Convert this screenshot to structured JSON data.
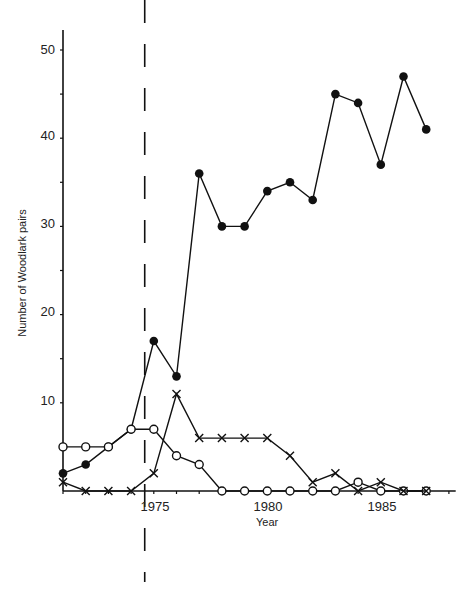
{
  "chart_data": {
    "type": "line",
    "title": "",
    "xlabel": "Year",
    "ylabel": "Number of Woodlark pairs",
    "x": [
      1971,
      1972,
      1973,
      1974,
      1975,
      1976,
      1977,
      1978,
      1979,
      1980,
      1981,
      1982,
      1983,
      1984,
      1985,
      1986,
      1987
    ],
    "xticks": [
      1975,
      1980,
      1985
    ],
    "yticks": [
      10,
      20,
      30,
      40,
      50
    ],
    "ylim": [
      0,
      52
    ],
    "xlim": [
      1971,
      1988.3
    ],
    "grid": false,
    "legend": "none",
    "annotations": [
      {
        "type": "vertical-dashed-line",
        "x": 1974.6
      }
    ],
    "series": [
      {
        "name": "filled-circles",
        "marker": "filled-circle",
        "values": [
          2,
          3,
          5,
          7,
          17,
          13,
          36,
          30,
          30,
          34,
          35,
          33,
          45,
          44,
          37,
          47,
          41
        ]
      },
      {
        "name": "open-circles",
        "marker": "open-circle",
        "values": [
          5,
          5,
          5,
          7,
          7,
          4,
          3,
          0,
          0,
          0,
          0,
          0,
          0,
          1,
          0,
          0,
          0
        ]
      },
      {
        "name": "crosses",
        "marker": "cross",
        "values": [
          1,
          0,
          0,
          0,
          2,
          11,
          6,
          6,
          6,
          6,
          4,
          1,
          2,
          0,
          1,
          0,
          0
        ]
      }
    ]
  },
  "labels": {
    "xlabel": "Year",
    "ylabel": "Number of Woodlark pairs",
    "xticks": [
      "1975",
      "1980",
      "1985"
    ],
    "yticks": [
      "10",
      "20",
      "30",
      "40",
      "50"
    ]
  }
}
